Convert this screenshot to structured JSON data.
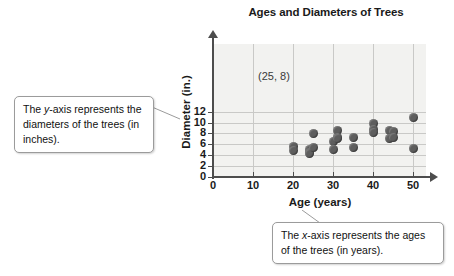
{
  "chart_data": {
    "type": "scatter",
    "title": "Ages and Diameters of Trees",
    "xlabel": "Age (years)",
    "ylabel": "Diameter (in.)",
    "xlim": [
      0,
      55
    ],
    "ylim": [
      0,
      13
    ],
    "xticks": [
      0,
      10,
      20,
      30,
      40,
      50
    ],
    "yticks": [
      0,
      2,
      4,
      6,
      8,
      10,
      12
    ],
    "grid": true,
    "legend": null,
    "annotations": [
      {
        "text": "(25, 8)",
        "x": 25,
        "y": 8
      }
    ],
    "points": [
      {
        "x": 20,
        "y": 5.6
      },
      {
        "x": 20,
        "y": 4.8
      },
      {
        "x": 24,
        "y": 5.0
      },
      {
        "x": 24,
        "y": 4.5
      },
      {
        "x": 24,
        "y": 4.3
      },
      {
        "x": 25,
        "y": 5.4
      },
      {
        "x": 25,
        "y": 7.9
      },
      {
        "x": 30,
        "y": 6.5
      },
      {
        "x": 30,
        "y": 5.1
      },
      {
        "x": 31,
        "y": 8.6
      },
      {
        "x": 31,
        "y": 7.3
      },
      {
        "x": 31,
        "y": 7.0
      },
      {
        "x": 35,
        "y": 7.2
      },
      {
        "x": 35,
        "y": 5.4
      },
      {
        "x": 40,
        "y": 9.9
      },
      {
        "x": 40,
        "y": 8.8
      },
      {
        "x": 40,
        "y": 8.2
      },
      {
        "x": 44,
        "y": 8.5
      },
      {
        "x": 45,
        "y": 8.4
      },
      {
        "x": 44,
        "y": 7.0
      },
      {
        "x": 45,
        "y": 7.2
      },
      {
        "x": 50,
        "y": 11.0
      },
      {
        "x": 50,
        "y": 5.3
      }
    ]
  },
  "callouts": {
    "y_axis": {
      "line1_pre": "The ",
      "line1_em": "y",
      "line1_post": "-axis represents the diameters of the trees (in inches)."
    },
    "x_axis": {
      "line1_pre": "The ",
      "line1_em": "x",
      "line1_post": "-axis represents the ages of the trees (in years)."
    }
  }
}
